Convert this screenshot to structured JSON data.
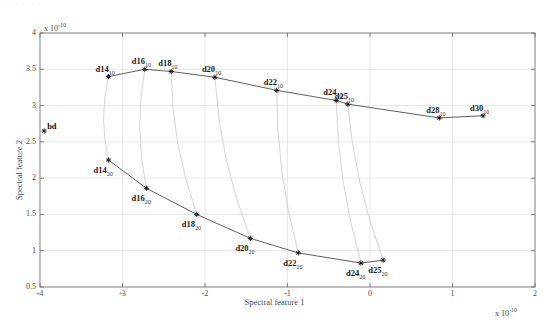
{
  "figure": {
    "top_artifact_text": "· ·  ·   ·    ·     ·      ·       ·        ·",
    "background_color": "#ffffff",
    "axis_color": "#6f6f72",
    "grid_color": "#d8d8dc",
    "curve_color": "#4d4d4d",
    "connector_color": "#c9c9cf",
    "marker_color": "#111111"
  },
  "axes": {
    "xlabel": "Spectral feature 1",
    "ylabel": "Spectral feature 2",
    "x_exponent_label": "x 10",
    "x_exponent_value": "-10",
    "y_exponent_label": "x 10",
    "y_exponent_value": "-10",
    "xticks": [
      "-4",
      "-3",
      "-2",
      "-1",
      "0",
      "1",
      "2"
    ],
    "xtick_values": [
      -4,
      -3,
      -2,
      -1,
      0,
      1,
      2
    ],
    "yticks": [
      "0.5",
      "1",
      "1.5",
      "2",
      "2.5",
      "3",
      "3.5",
      "4"
    ],
    "ytick_values": [
      0.5,
      1,
      1.5,
      2,
      2.5,
      3,
      3.5,
      4
    ],
    "xlim": [
      -4,
      2
    ],
    "ylim": [
      0.5,
      4
    ],
    "grid": true
  },
  "chart_data": {
    "type": "scatter",
    "title": "",
    "xlabel": "Spectral feature 1",
    "ylabel": "Spectral feature 2",
    "xlim": [
      -4,
      2
    ],
    "ylim": [
      0.5,
      4
    ],
    "grid": true,
    "legend": "none",
    "units_note": "both axes scaled by 1e-10",
    "series": [
      {
        "name": "depth 10",
        "subscript": "10",
        "marker": "star",
        "line": "solid",
        "points": [
          {
            "label": "d14",
            "sub": "10",
            "x": -3.17,
            "y": 3.4
          },
          {
            "label": "d16",
            "sub": "10",
            "x": -2.73,
            "y": 3.5
          },
          {
            "label": "d18",
            "sub": "10",
            "x": -2.41,
            "y": 3.47
          },
          {
            "label": "d20",
            "sub": "10",
            "x": -1.88,
            "y": 3.39
          },
          {
            "label": "d22",
            "sub": "10",
            "x": -1.13,
            "y": 3.21
          },
          {
            "label": "d24",
            "sub": "10",
            "x": -0.41,
            "y": 3.07
          },
          {
            "label": "d25",
            "sub": "10",
            "x": -0.27,
            "y": 3.02
          },
          {
            "label": "d28",
            "sub": "10",
            "x": 0.84,
            "y": 2.83
          },
          {
            "label": "d30",
            "sub": "10",
            "x": 1.37,
            "y": 2.86
          }
        ]
      },
      {
        "name": "depth 20",
        "subscript": "20",
        "marker": "star",
        "line": "solid",
        "points": [
          {
            "label": "d14",
            "sub": "20",
            "x": -3.17,
            "y": 2.25
          },
          {
            "label": "d16",
            "sub": "20",
            "x": -2.71,
            "y": 1.86
          },
          {
            "label": "d18",
            "sub": "20",
            "x": -2.1,
            "y": 1.5
          },
          {
            "label": "d20",
            "sub": "20",
            "x": -1.45,
            "y": 1.17
          },
          {
            "label": "d22",
            "sub": "20",
            "x": -0.87,
            "y": 0.97
          },
          {
            "label": "d24",
            "sub": "20",
            "x": -0.11,
            "y": 0.83
          },
          {
            "label": "d25",
            "sub": "20",
            "x": 0.16,
            "y": 0.87
          }
        ]
      }
    ],
    "connectors": [
      {
        "from": [
          -3.17,
          3.4
        ],
        "to": [
          -3.17,
          2.25
        ],
        "bow": -0.35
      },
      {
        "from": [
          -2.73,
          3.5
        ],
        "to": [
          -2.71,
          1.86
        ],
        "bow": -0.42
      },
      {
        "from": [
          -2.41,
          3.47
        ],
        "to": [
          -2.1,
          1.5
        ],
        "bow": -0.45
      },
      {
        "from": [
          -1.88,
          3.39
        ],
        "to": [
          -1.45,
          1.17
        ],
        "bow": -0.48
      },
      {
        "from": [
          -1.13,
          3.21
        ],
        "to": [
          -0.87,
          0.97
        ],
        "bow": -0.4
      },
      {
        "from": [
          -0.41,
          3.07
        ],
        "to": [
          -0.11,
          0.83
        ],
        "bow": -0.38
      },
      {
        "from": [
          -0.27,
          3.02
        ],
        "to": [
          0.16,
          0.87
        ],
        "bow": -0.4
      }
    ],
    "annotations": [
      {
        "label": "bd",
        "x": -3.95,
        "y": 2.65,
        "marker": true
      }
    ]
  }
}
